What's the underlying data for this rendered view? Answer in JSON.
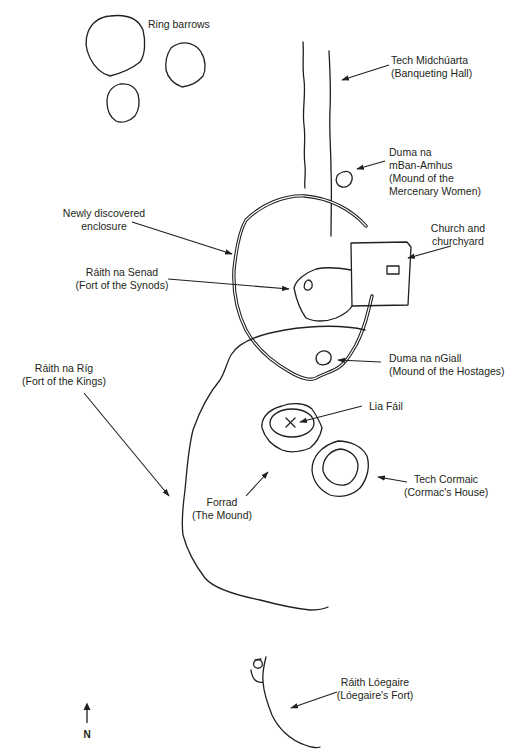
{
  "diagram": {
    "labels": {
      "ring_barrows": {
        "line1": "Ring barrows"
      },
      "tech_midchuarta": {
        "line1": "Tech Midchúarta",
        "line2": "(Banqueting Hall)"
      },
      "duma_mban_amhus": {
        "line1": "Duma na",
        "line2": "mBan-Amhus",
        "line3": "(Mound of the",
        "line4": "Mercenary Women)"
      },
      "newly_discovered": {
        "line1": "Newly discovered",
        "line2": "enclosure"
      },
      "church": {
        "line1": "Church and",
        "line2": "churchyard"
      },
      "raith_na_senad": {
        "line1": "Ráith na Senad",
        "line2": "(Fort of the Synods)"
      },
      "raith_na_rig": {
        "line1": "Ráith na Ríg",
        "line2": "(Fort of the Kings)"
      },
      "duma_na_ngiall": {
        "line1": "Duma na nGiall",
        "line2": "(Mound of the Hostages)"
      },
      "lia_fail": {
        "line1": "Lia Fáil"
      },
      "tech_cormaic": {
        "line1": "Tech Cormaic",
        "line2": "(Cormac's House)"
      },
      "forrad": {
        "line1": "Forrad",
        "line2": "(The Mound)"
      },
      "raith_loegaire": {
        "line1": "Ráith Lóegaire",
        "line2": "(Lóegaire's Fort)"
      }
    },
    "north_arrow": {
      "letter": "N",
      "icon": "north-arrow-icon"
    },
    "colors": {
      "ink": "#231f20",
      "background": "#ffffff"
    }
  }
}
